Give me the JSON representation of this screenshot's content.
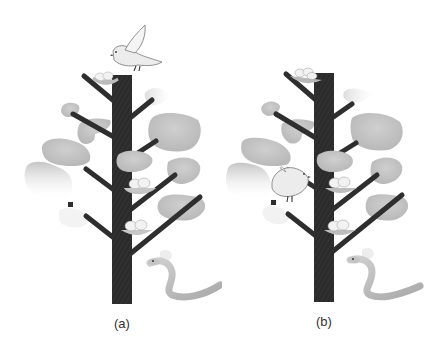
{
  "figure": {
    "panels": [
      {
        "id": "a",
        "label": "(a)",
        "bird_position": "flying above tree top",
        "nests": 3,
        "snake": true
      },
      {
        "id": "b",
        "label": "(b)",
        "bird_position": "perched on lower-left branch",
        "nests": 3,
        "snake": true
      }
    ]
  },
  "colors": {
    "trunk": "#2b2b2b",
    "branch": "#2e2e2e",
    "foliage": "#bdbdbd",
    "foliage_light": "#d6d6d6",
    "nest": "#b8b8b8",
    "egg": "#f2f2f2",
    "bird": "#ececec",
    "snake": "#bcbcbc",
    "label": "#333333"
  }
}
